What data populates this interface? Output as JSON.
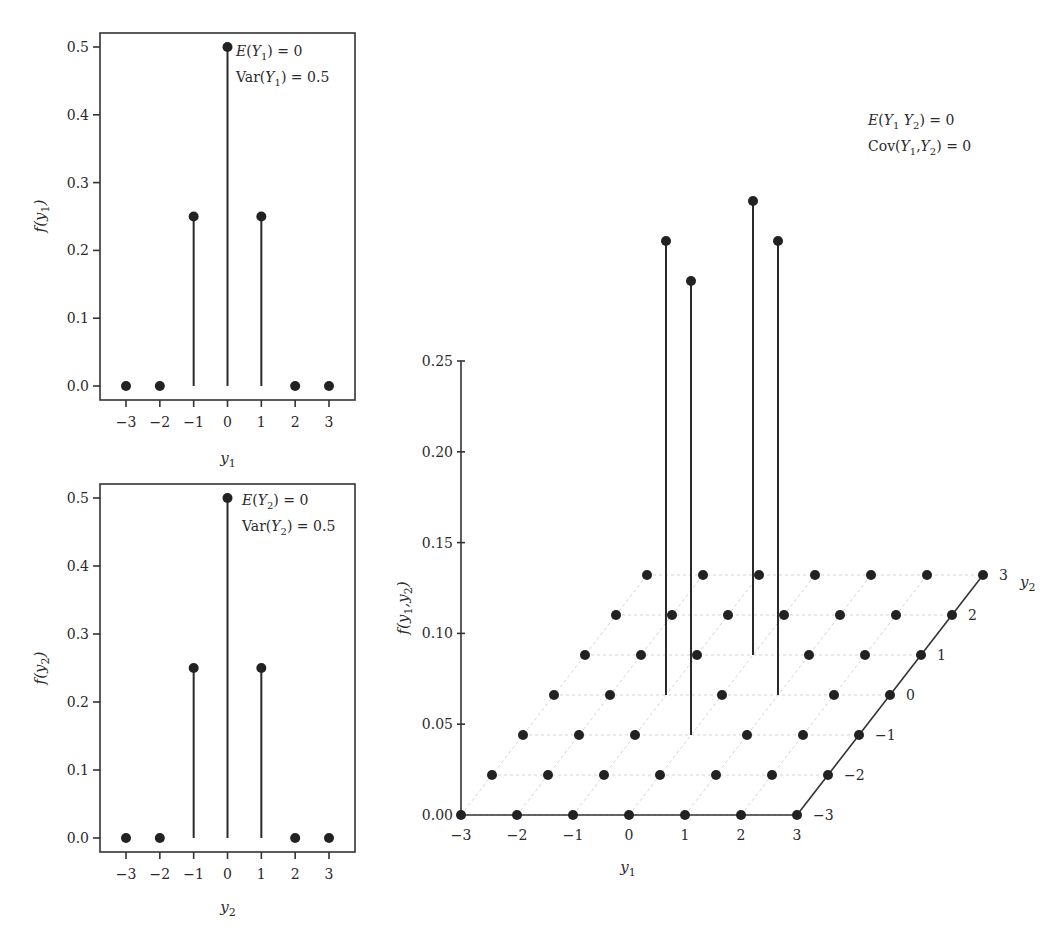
{
  "chart_data": [
    {
      "id": "marginal-y1",
      "type": "stem",
      "title": "",
      "xlabel": "y1",
      "ylabel": "f(y1)",
      "x": [
        -3,
        -2,
        -1,
        0,
        1,
        2,
        3
      ],
      "values": [
        0.0,
        0.0,
        0.25,
        0.5,
        0.25,
        0.0,
        0.0
      ],
      "xticks": [
        "−3",
        "−2",
        "−1",
        "0",
        "1",
        "2",
        "3"
      ],
      "yticks": [
        "0.0",
        "0.1",
        "0.2",
        "0.3",
        "0.4",
        "0.5"
      ],
      "ylim": [
        0,
        0.5
      ],
      "grid": false,
      "annotations": [
        "E(Y1) = 0",
        "Var(Y1) = 0.5"
      ]
    },
    {
      "id": "marginal-y2",
      "type": "stem",
      "title": "",
      "xlabel": "y2",
      "ylabel": "f(y2)",
      "x": [
        -3,
        -2,
        -1,
        0,
        1,
        2,
        3
      ],
      "values": [
        0.0,
        0.0,
        0.25,
        0.5,
        0.25,
        0.0,
        0.0
      ],
      "xticks": [
        "−3",
        "−2",
        "−1",
        "0",
        "1",
        "2",
        "3"
      ],
      "yticks": [
        "0.0",
        "0.1",
        "0.2",
        "0.3",
        "0.4",
        "0.5"
      ],
      "ylim": [
        0,
        0.5
      ],
      "grid": false,
      "annotations": [
        "E(Y2) = 0",
        "Var(Y2) = 0.5"
      ]
    },
    {
      "id": "joint-y1-y2",
      "type": "stem3d",
      "title": "",
      "xlabel": "y1",
      "ylabel": "y2",
      "zlabel": "f(y1,y2)",
      "y1_values": [
        -3,
        -2,
        -1,
        0,
        1,
        2,
        3
      ],
      "y2_values": [
        -3,
        -2,
        -1,
        0,
        1,
        2,
        3
      ],
      "nonzero_points": [
        {
          "y1": -1,
          "y2": 0,
          "f": 0.25
        },
        {
          "y1": 0,
          "y2": -1,
          "f": 0.25
        },
        {
          "y1": 0,
          "y2": 1,
          "f": 0.25
        },
        {
          "y1": 1,
          "y2": 0,
          "f": 0.25
        }
      ],
      "default_f": 0.0,
      "y1_ticks": [
        "−3",
        "−2",
        "−1",
        "0",
        "1",
        "2",
        "3"
      ],
      "y2_ticks": [
        "−3",
        "−2",
        "−1",
        "0",
        "1",
        "2",
        "3"
      ],
      "zticks": [
        "0.00",
        "0.05",
        "0.10",
        "0.15",
        "0.20",
        "0.25"
      ],
      "zlim": [
        0,
        0.25
      ],
      "grid": true,
      "annotations": [
        "E(Y1 Y2) = 0",
        "Cov(Y1,Y2) = 0"
      ]
    }
  ]
}
